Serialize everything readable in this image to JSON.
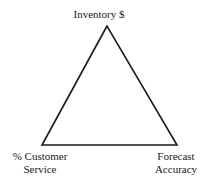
{
  "diagram": {
    "type": "triangle",
    "vertices": {
      "top": {
        "label": "Inventory $"
      },
      "bottom_left": {
        "label_line1": "% Customer",
        "label_line2": "Service"
      },
      "bottom_right": {
        "label_line1": "Forecast",
        "label_line2": "Accuracy"
      }
    },
    "stroke_color": "#1a1a1a",
    "background_color": "#ffffff"
  }
}
